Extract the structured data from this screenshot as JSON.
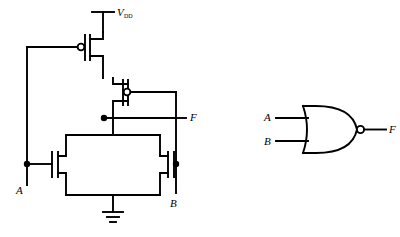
{
  "figure": {
    "type": "schematic-diagram",
    "background_color": "#ffffff",
    "line_color": "#000000"
  },
  "transistor_circuit": {
    "name": "cmos-nor-schematic",
    "supply": {
      "label": "V",
      "subscript": "DD"
    },
    "ground": {
      "label": ""
    },
    "inputs": [
      {
        "name": "input-a",
        "label": "A"
      },
      {
        "name": "input-b",
        "label": "B"
      }
    ],
    "output": {
      "name": "output-f",
      "label": "F"
    },
    "devices": [
      {
        "name": "pmos-a",
        "type": "PMOS",
        "gate": "A"
      },
      {
        "name": "pmos-b",
        "type": "PMOS",
        "gate": "B"
      },
      {
        "name": "nmos-a",
        "type": "NMOS",
        "gate": "A"
      },
      {
        "name": "nmos-b",
        "type": "NMOS",
        "gate": "B"
      }
    ]
  },
  "logic_symbol": {
    "name": "nor-gate-symbol",
    "gate_type": "NOR",
    "inputs": [
      {
        "name": "symbol-input-a",
        "label": "A"
      },
      {
        "name": "symbol-input-b",
        "label": "B"
      }
    ],
    "output": {
      "name": "symbol-output-f",
      "label": "F"
    },
    "inverting_bubble": true
  }
}
